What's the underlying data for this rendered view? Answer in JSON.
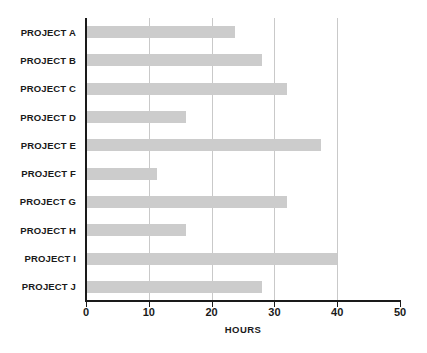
{
  "chart_data": {
    "type": "bar",
    "orientation": "horizontal",
    "title": "",
    "xlabel": "HOURS",
    "ylabel": "",
    "categories": [
      "PROJECT A",
      "PROJECT B",
      "PROJECT C",
      "PROJECT D",
      "PROJECT E",
      "PROJECT F",
      "PROJECT G",
      "PROJECT H",
      "PROJECT I",
      "PROJECT J"
    ],
    "values": [
      23.7,
      28,
      32,
      16,
      37.4,
      11.3,
      32,
      16,
      40,
      28
    ],
    "xlim": [
      0,
      50
    ],
    "xticks": [
      0,
      10,
      20,
      30,
      40,
      50
    ],
    "xtick_labels": [
      "0",
      "10",
      "20",
      "30",
      "40",
      "50"
    ],
    "gridlines_x": [
      10,
      20,
      30,
      40
    ],
    "grid": true,
    "legend": false,
    "bar_color": "#cccccc",
    "axis_color": "#1a1a1a",
    "grid_color": "#c9c9c9",
    "background": "#ffffff"
  }
}
